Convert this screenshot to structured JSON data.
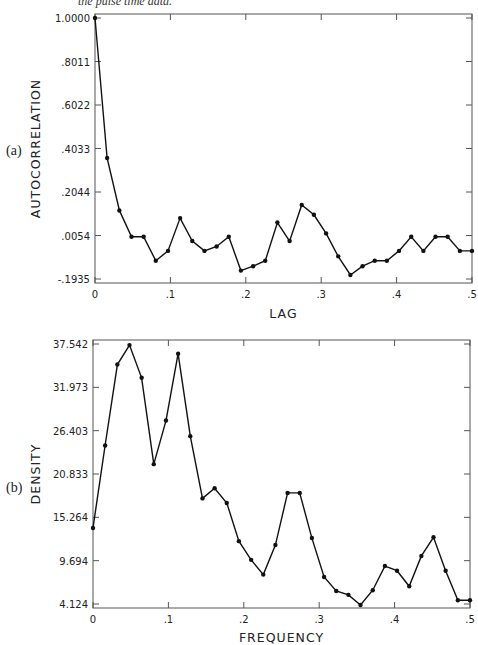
{
  "caption": "the pulse time data.",
  "chart_data": [
    {
      "type": "line",
      "panel_label": "(a)",
      "title": "",
      "xlabel": "LAG",
      "ylabel": "AUTOCORRELATION",
      "xlim": [
        0,
        0.5
      ],
      "ylim": [
        -0.1935,
        1.0
      ],
      "x_ticks": [
        "0",
        ".1",
        ".2",
        ".3",
        ".4",
        ".5"
      ],
      "y_ticks": [
        "1.0000",
        ".8011",
        ".6022",
        ".4033",
        ".2044",
        ".0054",
        "-.1935"
      ],
      "grid": false,
      "markers": true,
      "x": [
        0.0,
        0.0161,
        0.0323,
        0.0484,
        0.0645,
        0.0806,
        0.0968,
        0.1129,
        0.129,
        0.1452,
        0.1613,
        0.1774,
        0.1935,
        0.2097,
        0.2258,
        0.2419,
        0.2581,
        0.2742,
        0.2903,
        0.3065,
        0.3226,
        0.3387,
        0.3548,
        0.371,
        0.3871,
        0.4032,
        0.4194,
        0.4355,
        0.4516,
        0.4677,
        0.4839,
        0.5
      ],
      "values": [
        1.0,
        0.36,
        0.12,
        0.0,
        0.0,
        -0.11,
        -0.065,
        0.085,
        -0.02,
        -0.065,
        -0.045,
        0.0,
        -0.155,
        -0.135,
        -0.11,
        0.065,
        -0.02,
        0.145,
        0.1,
        0.015,
        -0.09,
        -0.175,
        -0.135,
        -0.11,
        -0.11,
        -0.065,
        0.0,
        -0.065,
        0.0,
        0.0,
        -0.065,
        -0.065
      ]
    },
    {
      "type": "line",
      "panel_label": "(b)",
      "title": "",
      "xlabel": "FREQUENCY",
      "ylabel": "DENSITY",
      "xlim": [
        0,
        0.5
      ],
      "ylim": [
        4.124,
        37.542
      ],
      "x_ticks": [
        "0",
        ".1",
        ".2",
        ".3",
        ".4",
        ".5"
      ],
      "y_ticks": [
        "37.542",
        "31.973",
        "26.403",
        "20.833",
        "15.264",
        "9.694",
        "4.124"
      ],
      "grid": false,
      "markers": true,
      "x": [
        0.0,
        0.0161,
        0.0323,
        0.0484,
        0.0645,
        0.0806,
        0.0968,
        0.1129,
        0.129,
        0.1452,
        0.1613,
        0.1774,
        0.1935,
        0.2097,
        0.2258,
        0.2419,
        0.2581,
        0.2742,
        0.2903,
        0.3065,
        0.3226,
        0.3387,
        0.3548,
        0.371,
        0.3871,
        0.4032,
        0.4194,
        0.4355,
        0.4516,
        0.4677,
        0.4839,
        0.5
      ],
      "values": [
        13.9,
        24.5,
        34.9,
        37.4,
        33.2,
        22.1,
        27.7,
        36.3,
        25.7,
        17.7,
        19.0,
        17.1,
        12.2,
        9.8,
        7.9,
        11.7,
        18.4,
        18.4,
        12.6,
        7.6,
        5.8,
        5.3,
        4.0,
        5.9,
        9.0,
        8.4,
        6.4,
        10.3,
        12.7,
        8.4,
        4.6,
        4.6
      ]
    }
  ]
}
